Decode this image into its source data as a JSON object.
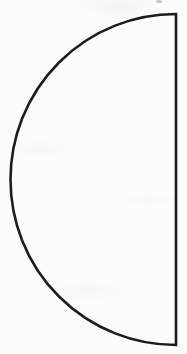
{
  "window": {
    "width": 187,
    "height": 354,
    "background_color": "#fcfcfa"
  },
  "figure": {
    "type": "semicircle",
    "path": "M 176 14 A 165.5 165.5 0 0 0 176 345 Z",
    "stroke_color": "#1c1c1c",
    "stroke_width": "2.6",
    "fill": "none",
    "chord_x": 176,
    "chord_top_y": 14,
    "chord_bottom_y": 345,
    "radius": 165.5,
    "leftmost_x": 10
  },
  "artifacts": {
    "top_speck": {
      "description": "tiny stray gray mark at top edge (scan artifact)",
      "color": "#9a9a9a"
    }
  }
}
